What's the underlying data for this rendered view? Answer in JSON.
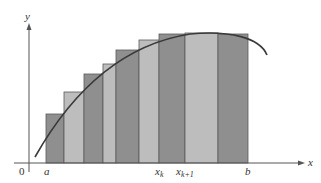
{
  "figure": {
    "width": 321,
    "height": 183,
    "colors": {
      "background": "#ffffff",
      "dark_rect": "#8f8f8f",
      "light_rect": "#bdbdbd",
      "rect_stroke": "#5a5a5a",
      "axis": "#555555",
      "curve": "#3a3a3a"
    },
    "axes": {
      "origin_label": "0",
      "x_label": "x",
      "y_label": "y"
    },
    "tick_labels": {
      "a": "a",
      "x_k_base": "x",
      "x_k_sub": "k",
      "x_k1_base": "x",
      "x_k1_sub": "k+1",
      "b": "b"
    },
    "rectangles": [
      {
        "x0": 46,
        "x1": 64,
        "top": 114,
        "shade": "dark"
      },
      {
        "x0": 64,
        "x1": 84,
        "top": 92,
        "shade": "light"
      },
      {
        "x0": 84,
        "x1": 103,
        "top": 74,
        "shade": "dark"
      },
      {
        "x0": 103,
        "x1": 116,
        "top": 64,
        "shade": "light"
      },
      {
        "x0": 116,
        "x1": 139,
        "top": 50,
        "shade": "dark"
      },
      {
        "x0": 139,
        "x1": 159,
        "top": 40,
        "shade": "light"
      },
      {
        "x0": 159,
        "x1": 185,
        "top": 34,
        "shade": "dark"
      },
      {
        "x0": 185,
        "x1": 218,
        "top": 33,
        "shade": "light"
      },
      {
        "x0": 218,
        "x1": 248,
        "top": 34,
        "shade": "dark"
      }
    ],
    "baseline_y": 163
  }
}
